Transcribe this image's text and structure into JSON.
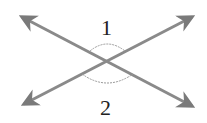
{
  "diagram": {
    "type": "intersecting-lines",
    "labels": {
      "angle_top": "1",
      "angle_bottom": "2"
    },
    "colors": {
      "line": "#8a8a8a",
      "arrow": "#7a7a7a",
      "arc": "#9a9a9a",
      "text": "#222222"
    }
  }
}
